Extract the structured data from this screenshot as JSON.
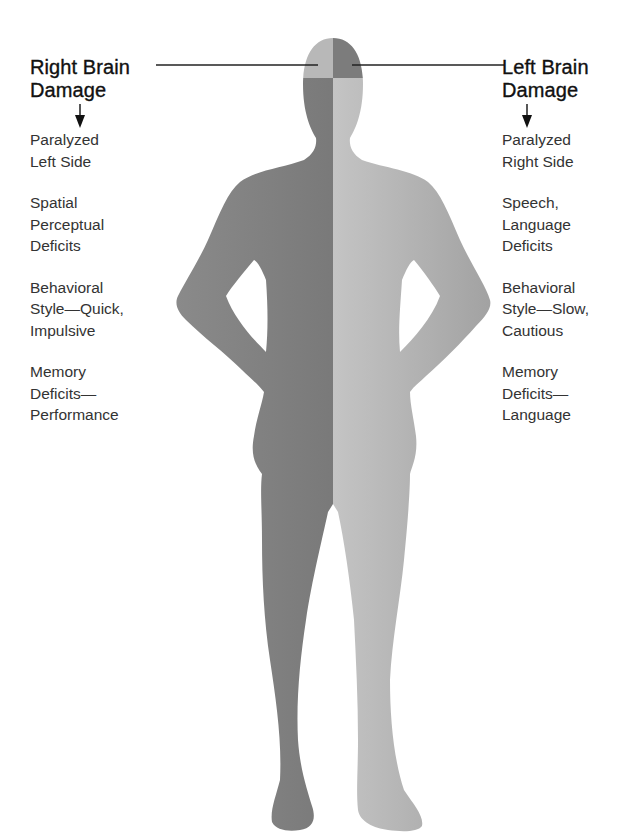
{
  "left_panel": {
    "heading_line1": "Right Brain",
    "heading_line2": "Damage",
    "items": [
      {
        "line1": "Paralyzed",
        "line2": "Left Side",
        "line3": ""
      },
      {
        "line1": "Spatial",
        "line2": "Perceptual",
        "line3": "Deficits"
      },
      {
        "line1": "Behavioral",
        "line2": "Style—Quick,",
        "line3": "Impulsive"
      },
      {
        "line1": "Memory",
        "line2": "Deficits—",
        "line3": "Performance"
      }
    ]
  },
  "right_panel": {
    "heading_line1": "Left Brain",
    "heading_line2": "Damage",
    "items": [
      {
        "line1": "Paralyzed",
        "line2": "Right Side",
        "line3": ""
      },
      {
        "line1": "Speech,",
        "line2": "Language",
        "line3": "Deficits"
      },
      {
        "line1": "Behavioral",
        "line2": "Style—Slow,",
        "line3": "Cautious"
      },
      {
        "line1": "Memory",
        "line2": "Deficits—",
        "line3": "Language"
      }
    ]
  },
  "figure": {
    "colors": {
      "dark_side": "#7a7a7a",
      "light_side": "#b4b4b4",
      "line": "#222222"
    }
  }
}
